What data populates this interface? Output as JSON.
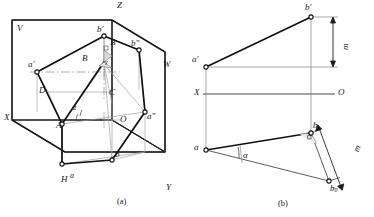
{
  "figure": {
    "captions": [
      {
        "id": "cap-a",
        "text": "(a)",
        "x": 117,
        "y": 199
      },
      {
        "id": "cap-b",
        "text": "(b)",
        "x": 278,
        "y": 201
      }
    ],
    "colors": {
      "ink": "#1a1a1a",
      "heavy": "#111111",
      "light": "#8a8a8a",
      "thin": "#555555",
      "paper": "#ffffff",
      "hatch": "#9a9a9a"
    }
  },
  "panel_a": {
    "name": "axonometric-projection-box",
    "plane_labels": [
      {
        "id": "plane-V",
        "text": "V",
        "x": 17,
        "y": 27,
        "size": 9
      },
      {
        "id": "plane-W",
        "text": "W",
        "x": 163,
        "y": 63,
        "size": 9
      },
      {
        "id": "plane-H",
        "text": "H",
        "x": 61,
        "y": 178,
        "size": 9
      }
    ],
    "axis_labels": [
      {
        "id": "axis-X",
        "text": "X",
        "x": 6,
        "y": 116,
        "size": 9
      },
      {
        "id": "axis-Y",
        "text": "Y",
        "x": 166,
        "y": 186,
        "size": 9
      },
      {
        "id": "axis-Z",
        "text": "Z",
        "x": 117,
        "y": 3,
        "size": 9
      },
      {
        "id": "origin-O",
        "text": "O",
        "x": 121,
        "y": 118,
        "size": 9
      }
    ],
    "point_labels": [
      {
        "id": "pt-a-prime",
        "text": "a′",
        "x": 31,
        "y": 64,
        "size": 9
      },
      {
        "id": "pt-b-prime",
        "text": "b′",
        "x": 97,
        "y": 29,
        "size": 9
      },
      {
        "id": "pt-b-dprime",
        "text": "b″",
        "x": 132,
        "y": 44,
        "size": 9
      },
      {
        "id": "pt-a-dprime",
        "text": "a″",
        "x": 148,
        "y": 116,
        "size": 9
      },
      {
        "id": "pt-A",
        "text": "A",
        "x": 59,
        "y": 124,
        "size": 9
      },
      {
        "id": "pt-B-upper",
        "text": "B",
        "x": 110,
        "y": 42,
        "size": 9
      },
      {
        "id": "pt-B-mid",
        "text": "B",
        "x": 83,
        "y": 57,
        "size": 9
      },
      {
        "id": "pt-C",
        "text": "C",
        "x": 110,
        "y": 92,
        "size": 9
      },
      {
        "id": "pt-D",
        "text": "D",
        "x": 40,
        "y": 90,
        "size": 9
      },
      {
        "id": "pt-b-lower",
        "text": "b",
        "x": 116,
        "y": 152,
        "size": 9
      },
      {
        "id": "pt-a-lower",
        "text": "a",
        "x": 70,
        "y": 176,
        "size": 8
      }
    ],
    "angle_labels": [
      {
        "id": "angle-alpha-a",
        "text": "α",
        "x": 72,
        "y": 108,
        "size": 8
      },
      {
        "id": "angle-gamma-a",
        "text": "γ",
        "x": 106,
        "y": 62,
        "size": 7
      }
    ]
  },
  "panel_b": {
    "name": "orthographic-two-view-with-true-length",
    "axis_labels": [
      {
        "id": "b-axis-X",
        "text": "X",
        "x": 196,
        "y": 92,
        "size": 9
      },
      {
        "id": "b-origin-O",
        "text": "O",
        "x": 330,
        "y": 91,
        "size": 9
      }
    ],
    "point_labels": [
      {
        "id": "b-pt-a-prime",
        "text": "a′",
        "x": 193,
        "y": 57,
        "size": 9
      },
      {
        "id": "b-pt-b-prime",
        "text": "b′",
        "x": 297,
        "y": 6,
        "size": 9
      },
      {
        "id": "b-pt-a",
        "text": "a",
        "x": 193,
        "y": 145,
        "size": 9
      },
      {
        "id": "b-pt-b",
        "text": "b",
        "x": 317,
        "y": 127,
        "size": 9
      },
      {
        "id": "b-pt-b0",
        "text": "b",
        "x": 338,
        "y": 191,
        "size": 9,
        "subscript": "0"
      }
    ],
    "dimension_labels": [
      {
        "id": "dim-m-vertical",
        "text": "m",
        "x": 343,
        "y": 51,
        "size": 9,
        "rotated": true
      },
      {
        "id": "dim-m-inclined",
        "text": "m",
        "x": 358,
        "y": 155,
        "size": 9,
        "rotated": true
      }
    ],
    "angle_labels": [
      {
        "id": "b-angle-alpha",
        "text": "α",
        "x": 243,
        "y": 155,
        "size": 9
      }
    ]
  },
  "geometry_notes": {
    "panel_a_description": "Three mutually perpendicular projection planes V (frontal), H (horizontal), W (profile) shown in axonometric view with axes X, Y, Z meeting at origin O. Line AB with frontal projection a'b', horizontal projection ab, and profile projection a\"b\". Angle alpha between AB and horizontal plane, angle gamma marked at B.",
    "panel_b_description": "Two-view orthographic drawing. Frontal view a'b' above the XO ground line, horizontal view ab below. Right triangle method: b0 constructed so that a-b0 is the true length, with offset m equal to the Z-coordinate difference; alpha is the true inclination angle to the H plane."
  }
}
